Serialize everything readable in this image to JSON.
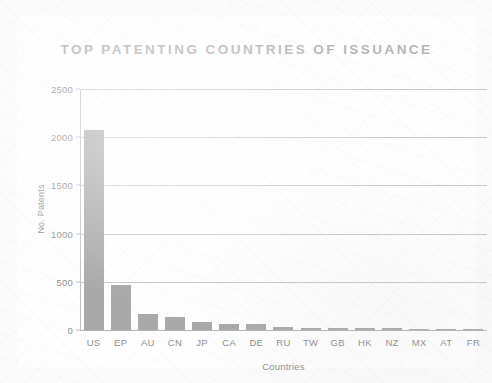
{
  "chart_data": {
    "type": "bar",
    "title": "TOP PATENTING COUNTRIES OF ISSUANCE",
    "xlabel": "Countries",
    "ylabel": "No. Patents",
    "categories": [
      "US",
      "EP",
      "AU",
      "CN",
      "JP",
      "CA",
      "DE",
      "RU",
      "TW",
      "GB",
      "HK",
      "NZ",
      "MX",
      "AT",
      "FR"
    ],
    "values": [
      2080,
      470,
      170,
      135,
      85,
      65,
      60,
      35,
      25,
      22,
      20,
      18,
      15,
      12,
      10
    ],
    "ylim": [
      0,
      2500
    ],
    "yticks": [
      0,
      500,
      1000,
      1500,
      2000,
      2500
    ],
    "ytick_labels": [
      "0",
      "500",
      "1000",
      "1500",
      "2000",
      "2500"
    ],
    "grid": true,
    "legend": null,
    "series_color": "#a9a9a9",
    "grid_color": "#c9c9c9",
    "text_color": "#8e8e8e",
    "title_color": "#b6b6b6",
    "background_color": "#fbfbfb"
  }
}
